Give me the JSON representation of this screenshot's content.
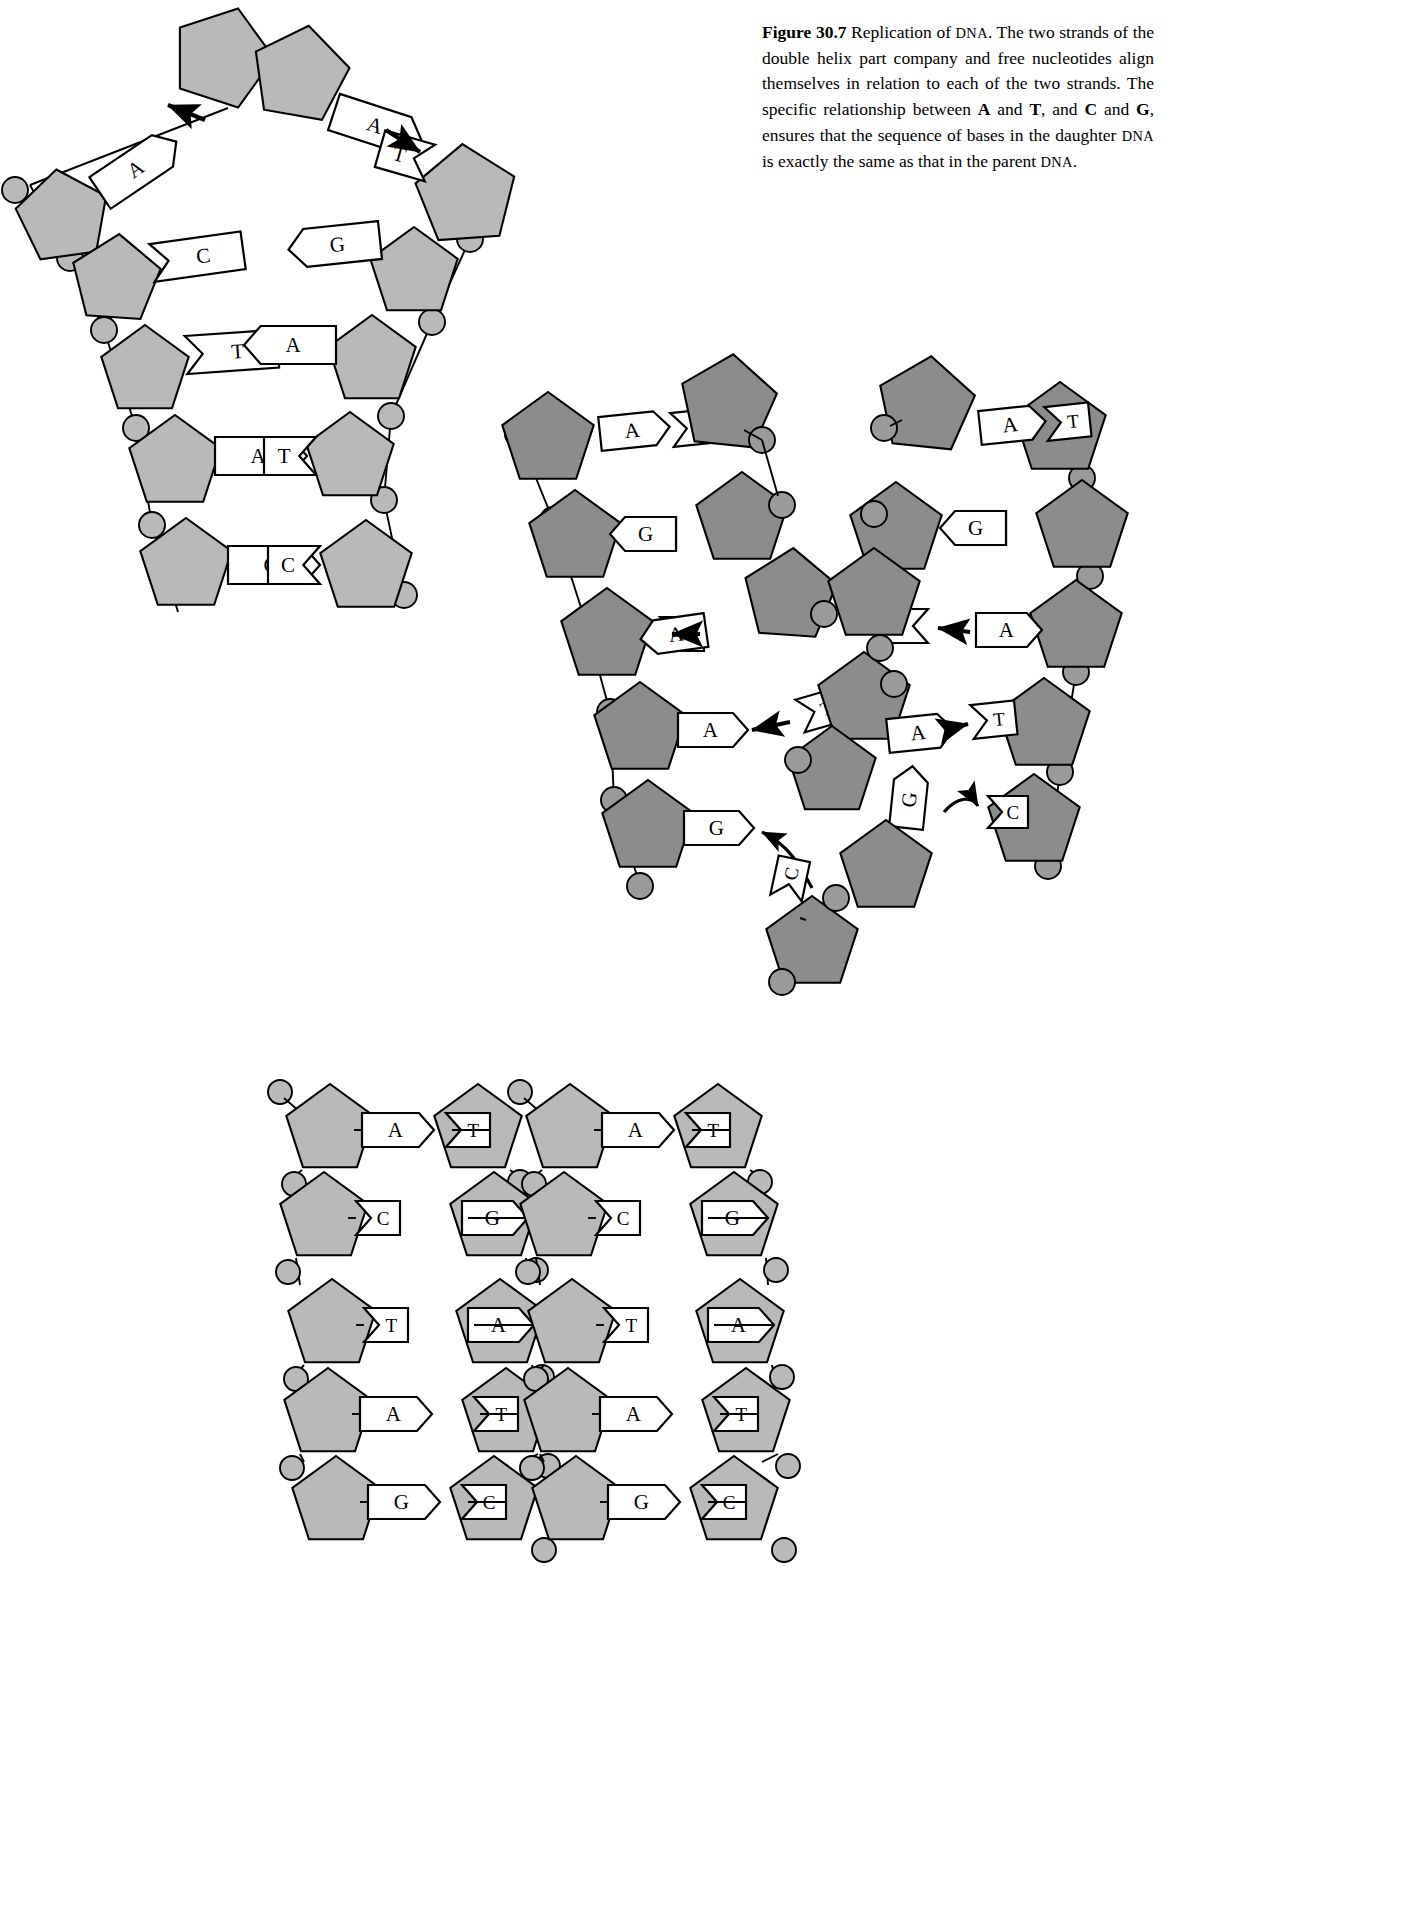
{
  "caption": {
    "figure_label": "Figure",
    "figure_number": "30.7",
    "line1_rest": "Replication of",
    "dna_1": "DNA",
    "line1_end": ". The two",
    "line2": "strands of the double helix part company and free",
    "line3": "nucleotides align themselves in relation to each of",
    "line4": "the two strands. The specific relationship between",
    "line5_a": "A",
    "line5_b": " and ",
    "line5_c": "T",
    "line5_d": ", and ",
    "line5_e": "C",
    "line5_f": " and ",
    "line5_g": "G",
    "line5_h": ", ensures that the sequence",
    "line6_a": "of bases in the daughter ",
    "dna_2": "DNA",
    "line6_b": " is exactly the same as",
    "line7_a": "that in the parent ",
    "dna_3": "DNA",
    "line7_b": "."
  },
  "colors": {
    "sugar_light": "#b9b9b9",
    "sugar_dark": "#8c8c8c",
    "outline": "#000000",
    "tag_fill": "#ffffff",
    "page_background": "#ffffff"
  },
  "chart_data": {
    "type": "diagram",
    "title": "Replication of DNA",
    "panels": [
      {
        "id": "parent-dna-unwinding",
        "name": "Parent DNA strands parting",
        "left_strand_bases": [
          "A",
          "C",
          "T",
          "A",
          "G"
        ],
        "right_strand_bases": [
          "T",
          "G",
          "A",
          "T",
          "C"
        ],
        "pairs": [
          "A-T",
          "C-G",
          "T-A",
          "A-T",
          "G-C"
        ],
        "separated_top": true
      },
      {
        "id": "replication-fork",
        "name": "Free nucleotides aligning on each template strand",
        "left_template_bases": [
          "A",
          "C",
          "A",
          "A",
          "G"
        ],
        "left_new_bases": [
          "T",
          "G",
          "T",
          "T",
          "C"
        ],
        "right_template_bases": [
          "T",
          "G",
          "T",
          "T",
          "C"
        ],
        "right_new_bases": [
          "A",
          "C",
          "A",
          "A",
          "G"
        ],
        "free_nucleotides": [
          "A",
          "T",
          "G",
          "C"
        ],
        "arrows": 4
      },
      {
        "id": "daughter-dna-molecules",
        "name": "Two identical daughter DNA molecules",
        "molecule_left_pairs": [
          "A-T",
          "C-G",
          "T-A",
          "A-T",
          "G-C"
        ],
        "molecule_right_pairs": [
          "A-T",
          "C-G",
          "T-A",
          "A-T",
          "G-C"
        ]
      }
    ],
    "base_pairing_rules": [
      "A-T",
      "C-G"
    ],
    "legend": {
      "pentagon": "deoxyribose sugar",
      "circle": "phosphate group",
      "tag": "nitrogenous base"
    }
  },
  "bases": {
    "A": "A",
    "T": "T",
    "C": "C",
    "G": "G"
  }
}
